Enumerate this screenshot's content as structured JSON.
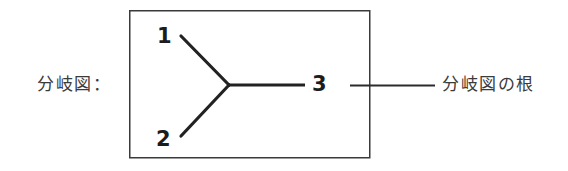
{
  "figure": {
    "caption_left": "分岐図：",
    "caption_right": "分岐図の根",
    "background_color": "#ffffff",
    "line_color": "#2b2b2b",
    "text_color": "#3b3b3b"
  },
  "cladogram": {
    "box": {
      "x": 129,
      "y": 10,
      "width": 241,
      "height": 148,
      "border_color": "#3a3a3a",
      "border_width": 1.5
    },
    "vertex": {
      "x": 229,
      "y": 85
    },
    "taxa": [
      {
        "label": "1",
        "tip_x": 181,
        "tip_y": 36
      },
      {
        "label": "2",
        "tip_x": 181,
        "tip_y": 136
      },
      {
        "label": "3",
        "tip_x": 305,
        "tip_y": 85
      }
    ],
    "root_line": {
      "x1": 350,
      "y1": 85,
      "x2": 435,
      "y2": 85
    },
    "branch_width": 3,
    "stem_width": 2.6,
    "root_width": 2
  }
}
